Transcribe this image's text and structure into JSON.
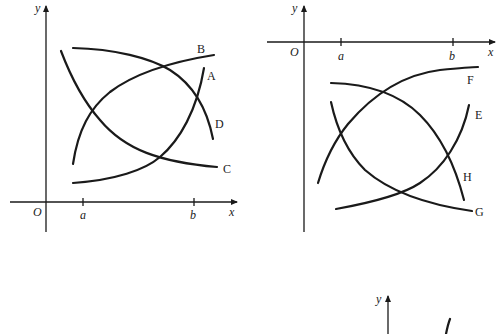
{
  "figure": {
    "panels": [
      {
        "id": "left",
        "axes": {
          "x_label": "x",
          "y_label": "y",
          "origin_label": "O"
        },
        "ticks": [
          {
            "label": "a"
          },
          {
            "label": "b"
          }
        ],
        "curves": [
          {
            "label": "A",
            "description": "increasing, concave up"
          },
          {
            "label": "B",
            "description": "increasing, concave down"
          },
          {
            "label": "C",
            "description": "decreasing, concave up"
          },
          {
            "label": "D",
            "description": "decreasing, concave down"
          }
        ],
        "region": "above x-axis"
      },
      {
        "id": "right",
        "axes": {
          "x_label": "x",
          "y_label": "y",
          "origin_label": "O"
        },
        "ticks": [
          {
            "label": "a"
          },
          {
            "label": "b"
          }
        ],
        "curves": [
          {
            "label": "E",
            "description": "increasing, concave up"
          },
          {
            "label": "F",
            "description": "increasing, concave down"
          },
          {
            "label": "G",
            "description": "decreasing, concave up"
          },
          {
            "label": "H",
            "description": "decreasing, concave down"
          }
        ],
        "region": "below x-axis"
      },
      {
        "id": "bottom-partial",
        "axes": {
          "y_label": "y"
        },
        "note": "partially visible third graph (cropped)"
      }
    ]
  }
}
